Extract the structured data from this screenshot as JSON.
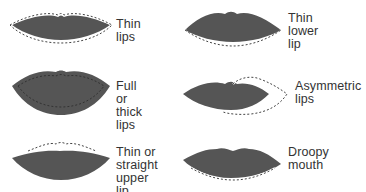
{
  "colors": {
    "lip_fill": "#555555",
    "lip_dark": "#4a4a4a",
    "dashed_outline": "#444444",
    "dash_light": "#ffffff",
    "text": "#333333"
  },
  "items": [
    {
      "label_lines": [
        "Thin",
        "lips"
      ],
      "label": "Thin lips"
    },
    {
      "label_lines": [
        "Thin",
        "lower",
        "lip"
      ],
      "label": "Thin lower lip"
    },
    {
      "label_lines": [
        "Full or",
        "thick lips"
      ],
      "label": "Full or thick lips"
    },
    {
      "label_lines": [
        "Asymmetric",
        "lips"
      ],
      "label": "Asymmetric lips"
    },
    {
      "label_lines": [
        "Thin or",
        "straight",
        "upper lip"
      ],
      "label": "Thin or straight upper lip"
    },
    {
      "label_lines": [
        "Droopy",
        "mouth"
      ],
      "label": "Droopy mouth"
    }
  ]
}
